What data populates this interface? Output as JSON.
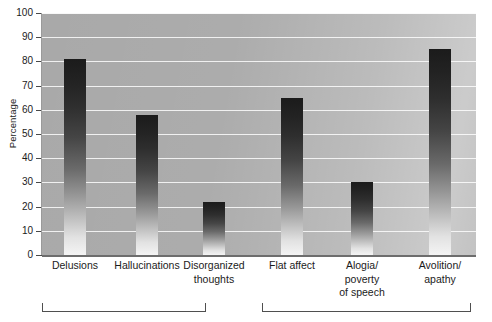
{
  "chart_data": {
    "type": "bar",
    "title": "",
    "xlabel": "",
    "ylabel": "Percentage",
    "ylim": [
      0,
      100
    ],
    "ytick_step": 10,
    "grid": true,
    "legend": "none",
    "categories": [
      "Delusions",
      "Hallucinations",
      "Disorganized thoughts",
      "Flat affect",
      "Alogia/ poverty of speech",
      "Avolition/ apathy"
    ],
    "values": [
      81,
      58,
      22,
      65,
      30,
      85
    ],
    "yticks": [
      "0",
      "10",
      "20",
      "30",
      "40",
      "50",
      "60",
      "70",
      "80",
      "90",
      "100"
    ],
    "groups": [
      {
        "label": "",
        "members": [
          "Delusions",
          "Hallucinations",
          "Disorganized thoughts"
        ]
      },
      {
        "label": "",
        "members": [
          "Flat affect",
          "Alogia/ poverty of speech",
          "Avolition/ apathy"
        ]
      }
    ],
    "colors": {
      "plot_background": "#a9a9a9",
      "gridline": "#ffffff",
      "bar_top": "#1b1b1b",
      "bar_bottom": "#f4f4f4",
      "axis": "#6d6d6d",
      "text": "#1b1b1b"
    }
  },
  "axis": {
    "ylabel": "Percentage",
    "yticks": [
      "100",
      "90",
      "80",
      "70",
      "60",
      "50",
      "40",
      "30",
      "20",
      "10",
      "0"
    ]
  },
  "xlabels": [
    {
      "lines": [
        "Delusions"
      ]
    },
    {
      "lines": [
        "Hallucinations"
      ]
    },
    {
      "lines": [
        "Disorganized",
        "thoughts"
      ]
    },
    {
      "lines": [
        "Flat affect"
      ]
    },
    {
      "lines": [
        "Alogia/",
        "poverty",
        "of speech"
      ]
    },
    {
      "lines": [
        "Avolition/",
        "apathy"
      ]
    }
  ]
}
